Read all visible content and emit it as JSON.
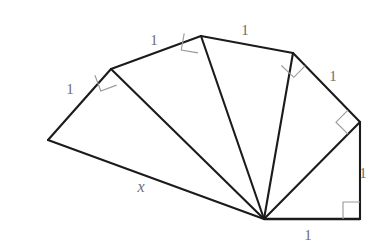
{
  "figure": {
    "type": "geometric-diagram",
    "canvas": {
      "width": 376,
      "height": 248,
      "background": "#ffffff"
    },
    "colors": {
      "edge_stroke": "#1b1b1b",
      "right_angle_stroke": "#9a9a9a",
      "label_text": "#6e6e6e",
      "background": "#ffffff"
    },
    "apex": {
      "x": 264,
      "y": 219
    },
    "vertices": [
      {
        "name": "bottom-right",
        "x": 360,
        "y": 219
      },
      {
        "name": "right",
        "x": 360,
        "y": 122
      },
      {
        "name": "upper-right",
        "x": 293,
        "y": 53
      },
      {
        "name": "top",
        "x": 201,
        "y": 36
      },
      {
        "name": "upper-left",
        "x": 111,
        "y": 69
      },
      {
        "name": "left",
        "x": 48,
        "y": 140
      }
    ],
    "spokes": [
      {
        "name": "spoke-hypotenuse-1",
        "from": "apex",
        "to": "bottom-right"
      },
      {
        "name": "spoke-hypotenuse-2",
        "from": "apex",
        "to": "right"
      },
      {
        "name": "spoke-hypotenuse-3",
        "from": "apex",
        "to": "upper-right"
      },
      {
        "name": "spoke-hypotenuse-4",
        "from": "apex",
        "to": "top"
      },
      {
        "name": "spoke-hypotenuse-5",
        "from": "apex",
        "to": "upper-left"
      },
      {
        "name": "spoke-hypotenuse-6",
        "from": "apex",
        "to": "left"
      }
    ],
    "labels": [
      {
        "id": "label-base",
        "text": "1",
        "x": 308,
        "y": 235,
        "italic": false
      },
      {
        "id": "label-right-vertical",
        "text": "1",
        "x": 363,
        "y": 173,
        "italic": false
      },
      {
        "id": "label-upper-right",
        "text": "1",
        "x": 333,
        "y": 76,
        "italic": false
      },
      {
        "id": "label-top-right",
        "text": "1",
        "x": 245,
        "y": 30,
        "italic": false
      },
      {
        "id": "label-top-left",
        "text": "1",
        "x": 154,
        "y": 40,
        "italic": false
      },
      {
        "id": "label-left",
        "text": "1",
        "x": 70,
        "y": 89,
        "italic": false
      },
      {
        "id": "label-x-hypotenuse",
        "text": "x",
        "x": 141,
        "y": 187,
        "italic": true
      }
    ],
    "right_angle_markers": [
      {
        "id": "right-angle-corner",
        "at_vertex": "bottom-right",
        "size": 17
      },
      {
        "id": "right-angle-right",
        "at_vertex": "right",
        "size": 17
      },
      {
        "id": "right-angle-upper-right",
        "at_vertex": "upper-right",
        "size": 17
      },
      {
        "id": "right-angle-top",
        "at_vertex": "top",
        "size": 17
      },
      {
        "id": "right-angle-upper-left",
        "at_vertex": "upper-left",
        "size": 17
      }
    ]
  }
}
